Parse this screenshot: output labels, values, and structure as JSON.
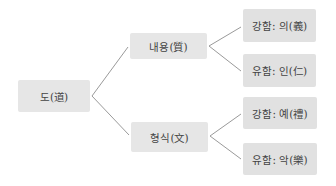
{
  "diagram": {
    "type": "tree",
    "root": {
      "label": "도(道)"
    },
    "branches": [
      {
        "label": "내용(質)",
        "children": [
          {
            "label": "강함: 의(義)"
          },
          {
            "label": "유함: 인(仁)"
          }
        ]
      },
      {
        "label": "형식(文)",
        "children": [
          {
            "label": "강함: 예(禮)"
          },
          {
            "label": "유함: 악(樂)"
          }
        ]
      }
    ],
    "colors": {
      "node_fill": "#e6e6e6",
      "leaf_fill": "#e1e1e1",
      "connector": "#9a9a9a",
      "text": "#444444"
    }
  }
}
